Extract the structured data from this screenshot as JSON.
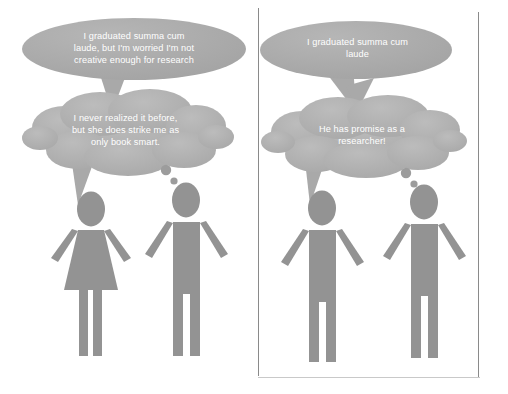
{
  "figure": {
    "type": "two-panel-comic",
    "theme": "gender-bias-in-evaluation-of-identical-statements",
    "colors": {
      "bubble_fill": "#a9a9a9",
      "bubble_fill_alt": "#b2b2b2",
      "figure_fill": "#939393",
      "bubble_text": "#ffffff",
      "divider": "#8a8a8a",
      "background": "#ffffff"
    }
  },
  "panels": [
    {
      "id": "left-panel",
      "name": "female-speaker-panel",
      "speech_bubble": {
        "shape": "ellipse",
        "text": "I graduated summa cum\nlaude, but I'm worried I'm not\ncreative enough for research",
        "speaker": "female-figure"
      },
      "thought_bubble": {
        "shape": "cloud",
        "text": "I never realized it before,\nbut she does strike me as\nonly book smart.",
        "thinker": "male-figure",
        "dots": 3
      },
      "figures": [
        {
          "name": "female-figure",
          "gender": "female",
          "pictogram": "woman-with-dress"
        },
        {
          "name": "male-figure",
          "gender": "male",
          "pictogram": "man"
        }
      ]
    },
    {
      "id": "right-panel",
      "name": "male-speaker-panel",
      "speech_bubble": {
        "shape": "ellipse",
        "text": "I graduated summa cum\nlaude",
        "speaker": "male-speaker-figure"
      },
      "thought_bubble": {
        "shape": "cloud",
        "text": "He has promise as a\nresearcher!",
        "thinker": "male-listener-figure",
        "dots": 3
      },
      "figures": [
        {
          "name": "male-speaker-figure",
          "gender": "male",
          "pictogram": "man"
        },
        {
          "name": "male-listener-figure",
          "gender": "male",
          "pictogram": "man"
        }
      ]
    }
  ]
}
